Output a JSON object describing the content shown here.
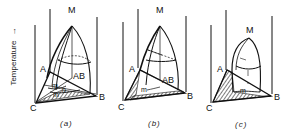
{
  "figure": {
    "y_axis_label": "Temperature",
    "y_axis_arrow": "→",
    "panels": [
      {
        "id": "a",
        "caption": "(a)",
        "labels": {
          "apex": "M",
          "left_top": "A",
          "left_bottom": "C",
          "right_bottom": "B",
          "region": "AB",
          "m": "m",
          "n": "n",
          "m2": "m"
        }
      },
      {
        "id": "b",
        "caption": "(b)",
        "labels": {
          "apex": "M",
          "left_top": "A",
          "left_bottom": "C",
          "right_bottom": "B",
          "region": "AB",
          "m": "m"
        }
      },
      {
        "id": "c",
        "caption": "(c)",
        "labels": {
          "apex": "M",
          "left_top": "A",
          "left_bottom": "C",
          "right_bottom": "B",
          "m": "m"
        }
      }
    ]
  }
}
